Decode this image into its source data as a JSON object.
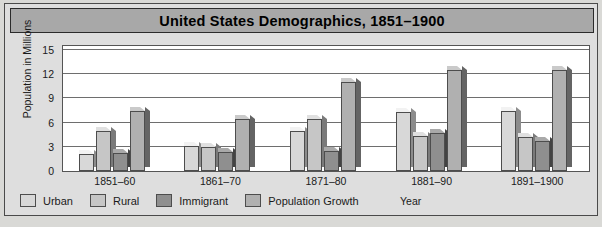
{
  "chart_data": {
    "type": "bar",
    "title": "United States  Demographics, 1851–1900",
    "xlabel": "Year",
    "ylabel": "Population in Millions",
    "categories": [
      "1851–60",
      "1861–70",
      "1871–80",
      "1881–90",
      "1891–1900"
    ],
    "yticks": [
      15,
      12,
      9,
      6,
      3,
      0
    ],
    "ylim": [
      0,
      15
    ],
    "grid": true,
    "legend_position": "bottom",
    "series": [
      {
        "name": "Urban",
        "color": "#d8d8d8",
        "values": [
          2.1,
          3.1,
          5.0,
          7.3,
          7.5
        ]
      },
      {
        "name": "Rural",
        "color": "#c6c6c6",
        "values": [
          5.0,
          3.0,
          6.5,
          4.4,
          4.2
        ]
      },
      {
        "name": "Immigrant",
        "color": "#8f8f8f",
        "values": [
          2.2,
          2.4,
          2.5,
          4.7,
          3.7
        ]
      },
      {
        "name": "Population Growth",
        "color": "#b0b0b0",
        "values": [
          7.5,
          6.4,
          11.0,
          12.5,
          12.5
        ]
      }
    ]
  },
  "colors": {
    "title_bar": "#a8a8a8",
    "card": "#dedede",
    "page": "#d9d9d6",
    "plot": "#ffffff",
    "gridline": "#6e6e6e",
    "outline": "#4d4d4d"
  },
  "source": {
    "text": ""
  }
}
